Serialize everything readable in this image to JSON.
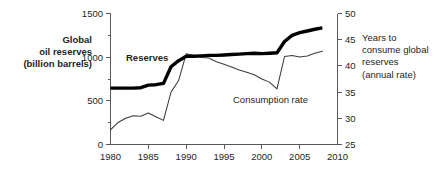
{
  "chart_data": {
    "type": "line",
    "title": "",
    "subtitle": "",
    "xlabel": "",
    "ylabel": "Global oil reserves (billion barrels)",
    "y2label": "Years to consume global reserves (annual rate)",
    "grid": false,
    "legend_position": "inline-annotations",
    "xlim": [
      1980,
      2010
    ],
    "ylim": [
      0,
      1500
    ],
    "y2lim": [
      25,
      50
    ],
    "x_ticks": [
      1980,
      1985,
      1990,
      1995,
      2000,
      2005,
      2010
    ],
    "x_tick_labels": [
      "1980",
      "1985",
      "1990",
      "1995",
      "2000",
      "2005",
      "2010"
    ],
    "y_ticks": [
      0,
      500,
      1000,
      1500
    ],
    "y_tick_labels": [
      "0",
      "500",
      "1000",
      "1500"
    ],
    "y_minor_ticks": [
      250,
      750,
      1250
    ],
    "y2_ticks": [
      25,
      30,
      35,
      40,
      45,
      50
    ],
    "y2_tick_labels": [
      "25",
      "30",
      "35",
      "40",
      "45",
      "50"
    ],
    "series": [
      {
        "name": "Reserves",
        "axis": "left",
        "unit": "billion barrels",
        "style": "thick-black-line",
        "x": [
          1980,
          1981,
          1982,
          1983,
          1984,
          1985,
          1986,
          1987,
          1988,
          1989,
          1990,
          1991,
          1992,
          1993,
          1994,
          1995,
          1996,
          1997,
          1998,
          1999,
          2000,
          2001,
          2002,
          2003,
          2004,
          2005,
          2006,
          2007,
          2008
        ],
        "values": [
          645,
          645,
          645,
          645,
          650,
          680,
          685,
          700,
          890,
          960,
          1010,
          1010,
          1015,
          1020,
          1020,
          1025,
          1030,
          1035,
          1040,
          1045,
          1040,
          1045,
          1050,
          1180,
          1250,
          1280,
          1300,
          1320,
          1335
        ]
      },
      {
        "name": "Consumption rate",
        "axis": "right",
        "unit": "years",
        "style": "thin-line",
        "x": [
          1980,
          1981,
          1982,
          1983,
          1984,
          1985,
          1986,
          1987,
          1988,
          1989,
          1990,
          1991,
          1992,
          1993,
          1994,
          1995,
          1996,
          1997,
          1998,
          1999,
          2000,
          2001,
          2002,
          2003,
          2004,
          2005,
          2006,
          2007,
          2008
        ],
        "values": [
          27.8,
          29.2,
          30.0,
          30.5,
          30.4,
          31.0,
          30.3,
          29.6,
          35.0,
          37.2,
          42.3,
          42.0,
          41.6,
          41.5,
          40.8,
          40.3,
          39.8,
          39.2,
          38.8,
          38.3,
          37.5,
          36.9,
          35.6,
          41.8,
          42.0,
          41.7,
          41.9,
          42.4,
          42.8
        ]
      }
    ],
    "annotations": [
      {
        "text": "Reserves",
        "series": "Reserves",
        "bold": true
      },
      {
        "text": "Consumption rate",
        "series": "Consumption rate",
        "bold": false
      }
    ],
    "colors": {
      "reserves_line": "#000000",
      "consumption_line": "#3c3c3e",
      "axis": "#58585a",
      "text": "#231f20",
      "background": "#ffffff"
    }
  },
  "left_axis_title_lines": [
    "Global",
    "oil reserves",
    "(billion barrels)"
  ],
  "right_axis_title_lines": [
    "Years to",
    "consume global",
    "reserves",
    "(annual rate)"
  ],
  "labels": {
    "reserves": "Reserves",
    "consumption": "Consumption rate"
  }
}
